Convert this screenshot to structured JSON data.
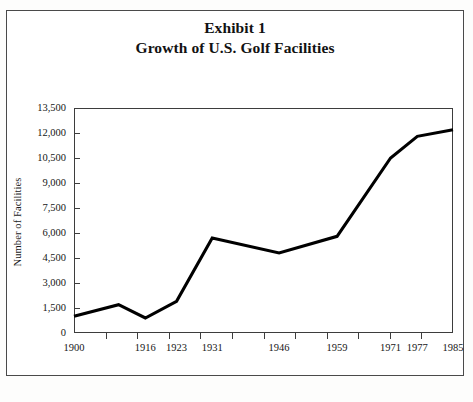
{
  "figure": {
    "title_line_1": "Exhibit 1",
    "title_line_2": "Growth of U.S. Golf Facilities"
  },
  "chart_data": {
    "type": "line",
    "subtitle": "Growth of U.S. Golf Facilities",
    "xlabel": "",
    "ylabel": "Number of Facilities",
    "grid": false,
    "legend": false,
    "legend_position": "none",
    "xlim": [
      1900,
      1985
    ],
    "ylim": [
      0,
      13500
    ],
    "ytick_step": 1500,
    "ytick_labels": [
      "0",
      "1,500",
      "3,000",
      "4,500",
      "6,000",
      "7,500",
      "9,000",
      "10,500",
      "12,000",
      "13,500"
    ],
    "ytick_values": [
      0,
      1500,
      3000,
      4500,
      6000,
      7500,
      9000,
      10500,
      12000,
      13500
    ],
    "xtick_labels": [
      "1900",
      "1916",
      "1923",
      "1931",
      "1946",
      "1959",
      "1971",
      "1977",
      "1985"
    ],
    "xtick_values": [
      1900,
      1916,
      1923,
      1931,
      1946,
      1959,
      1971,
      1977,
      1985
    ],
    "x": [
      1900,
      1910,
      1916,
      1923,
      1931,
      1946,
      1959,
      1971,
      1977,
      1985
    ],
    "values": [
      1000,
      1700,
      900,
      1900,
      5700,
      4800,
      5800,
      10500,
      11800,
      12200
    ],
    "series": [
      {
        "name": "Number of Facilities",
        "x": [
          1900,
          1910,
          1916,
          1923,
          1931,
          1946,
          1959,
          1971,
          1977,
          1985
        ],
        "values": [
          1000,
          1700,
          900,
          1900,
          5700,
          4800,
          5800,
          10500,
          11800,
          12200
        ],
        "color": "#000000"
      }
    ]
  },
  "style": {
    "line_color": "#000000",
    "axis_color": "#3d3d3d",
    "border_color": "#4a4a4a",
    "text_color": "#161616",
    "background": "#ffffff"
  }
}
